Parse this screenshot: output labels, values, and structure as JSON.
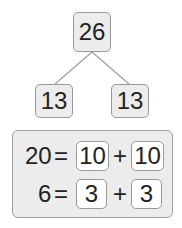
{
  "tree": {
    "root": "26",
    "left": "13",
    "right": "13"
  },
  "equations": [
    {
      "total": "20",
      "eq": "=",
      "a": "10",
      "op": "+",
      "b": "10"
    },
    {
      "total": "6",
      "eq": "=",
      "a": "3",
      "op": "+",
      "b": "3"
    }
  ],
  "colors": {
    "box_fill": "#ececec",
    "box_border": "#9a9a9a",
    "line": "#9a9a9a"
  }
}
